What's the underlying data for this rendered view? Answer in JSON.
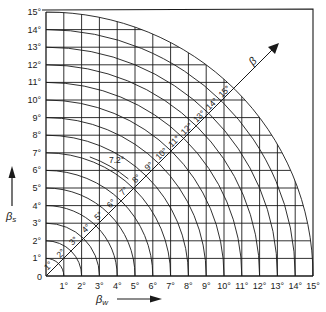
{
  "diagram": {
    "type": "angle-chart",
    "x_axis": {
      "label": "β",
      "label_sub": "w",
      "range": [
        0,
        15
      ],
      "ticks": [
        "1°",
        "2°",
        "3°",
        "4°",
        "5°",
        "6°",
        "7°",
        "8°",
        "9°",
        "10°",
        "11°",
        "12°",
        "13°",
        "14°",
        "15°"
      ],
      "arrow": "right"
    },
    "y_axis": {
      "label": "β",
      "label_sub": "s",
      "range": [
        0,
        15
      ],
      "ticks": [
        "1°",
        "2°",
        "3°",
        "4°",
        "5°",
        "6°",
        "7°",
        "8°",
        "9°",
        "10°",
        "11°",
        "12°",
        "13°",
        "14°",
        "15°"
      ],
      "arrow": "up"
    },
    "origin_label": "0",
    "resultant_axis": {
      "label": "β",
      "direction_deg": 45,
      "arc_values": [
        1,
        2,
        3,
        4,
        5,
        6,
        7,
        8,
        9,
        10,
        11,
        12,
        13,
        14,
        15
      ],
      "arc_labels": [
        "1°",
        "2°",
        "3°",
        "4°",
        "5°",
        "6°",
        "7°",
        "8°",
        "9°",
        "10°",
        "11°",
        "12°",
        "13°",
        "14°",
        "15°"
      ]
    },
    "highlight_arc": {
      "value": 7.2,
      "label": "7.2°"
    },
    "grid": {
      "step": 1,
      "clipped_to_arc": 15
    },
    "colors": {
      "ink": "#1a1a1a",
      "background": "#ffffff"
    }
  }
}
